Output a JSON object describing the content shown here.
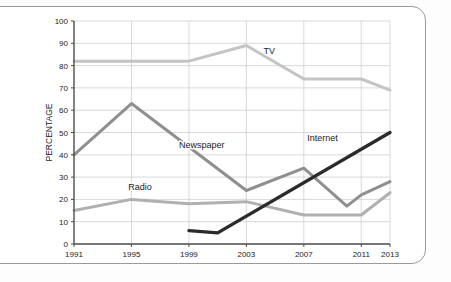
{
  "chart_data": {
    "type": "line",
    "title": "",
    "xlabel": "",
    "ylabel": "PERCENTAGE",
    "xlim": [
      1991,
      2013
    ],
    "ylim": [
      0,
      100
    ],
    "grid": true,
    "legend_position": "inline-labels",
    "x_ticks": [
      "1991",
      "1995",
      "1999",
      "2003",
      "2007",
      "2011",
      "2013"
    ],
    "y_ticks": [
      "0",
      "10",
      "20",
      "30",
      "40",
      "50",
      "60",
      "70",
      "80",
      "90",
      "100"
    ],
    "series": [
      {
        "name": "TV",
        "color": "#c4c4c4",
        "label_x": 2004.6,
        "label_y": 85,
        "points": [
          {
            "x": 1991,
            "y": 82
          },
          {
            "x": 1995,
            "y": 82
          },
          {
            "x": 1999,
            "y": 82
          },
          {
            "x": 2003,
            "y": 89
          },
          {
            "x": 2007,
            "y": 74
          },
          {
            "x": 2011,
            "y": 74
          },
          {
            "x": 2013,
            "y": 69
          }
        ]
      },
      {
        "name": "Newspaper",
        "color": "#8f8f8f",
        "label_x": 1999.9,
        "label_y": 43,
        "points": [
          {
            "x": 1991,
            "y": 40
          },
          {
            "x": 1995,
            "y": 63
          },
          {
            "x": 2003,
            "y": 24
          },
          {
            "x": 2007,
            "y": 34
          },
          {
            "x": 2010,
            "y": 17
          },
          {
            "x": 2011,
            "y": 22
          },
          {
            "x": 2013,
            "y": 28
          }
        ]
      },
      {
        "name": "Radio",
        "color": "#b0b0b0",
        "label_x": 1995.6,
        "label_y": 24,
        "points": [
          {
            "x": 1991,
            "y": 15
          },
          {
            "x": 1995,
            "y": 20
          },
          {
            "x": 1999,
            "y": 18
          },
          {
            "x": 2003,
            "y": 19
          },
          {
            "x": 2007,
            "y": 13
          },
          {
            "x": 2011,
            "y": 13
          },
          {
            "x": 2013,
            "y": 23
          }
        ]
      },
      {
        "name": "Internet",
        "color": "#2b2b2b",
        "label_x": 2008.3,
        "label_y": 46,
        "points": [
          {
            "x": 1999,
            "y": 6
          },
          {
            "x": 2001,
            "y": 5
          },
          {
            "x": 2013,
            "y": 50
          }
        ]
      }
    ]
  }
}
